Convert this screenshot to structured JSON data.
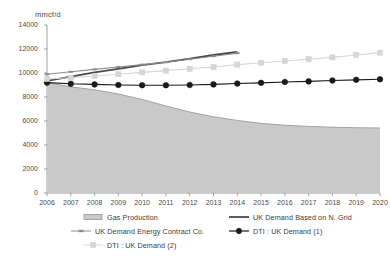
{
  "chart_data": {
    "type": "line",
    "title": "",
    "subtitle": "",
    "xlabel": "",
    "ylabel": "mmcf/d",
    "ylim": [
      0,
      14000
    ],
    "xlim": [
      2006,
      2020
    ],
    "grid": false,
    "legend_position": "bottom",
    "y_ticks": [
      "0",
      "2000",
      "4000",
      "6000",
      "8000",
      "10000",
      "12000",
      "14000"
    ],
    "y_tick_values": [
      0,
      2000,
      4000,
      6000,
      8000,
      10000,
      12000,
      14000
    ],
    "categories": [
      "2006",
      "2007",
      "2008",
      "2009",
      "2010",
      "2011",
      "2012",
      "2013",
      "2014",
      "2015",
      "2016",
      "2017",
      "2018",
      "2019",
      "2020"
    ],
    "x": [
      2006,
      2007,
      2008,
      2009,
      2010,
      2011,
      2012,
      2013,
      2014,
      2015,
      2016,
      2017,
      2018,
      2019,
      2020
    ],
    "series": [
      {
        "name": "Gas Production",
        "type": "area",
        "color": "#c9c9c9",
        "edge_color": "#9a9a9a",
        "values": [
          9200,
          8850,
          8600,
          8250,
          7800,
          7250,
          6750,
          6350,
          6050,
          5800,
          5650,
          5550,
          5480,
          5440,
          5420
        ]
      },
      {
        "name": "UK Demand Based on N. Grid",
        "type": "line",
        "color": "#4a4a4a",
        "marker": "none",
        "values": [
          9350,
          9700,
          10050,
          10350,
          10650,
          10900,
          11200,
          11500,
          11750,
          null,
          null,
          null,
          null,
          null,
          null
        ]
      },
      {
        "name": "UK Demand Energy Contract Co.",
        "type": "line",
        "color": "#8c8c8c",
        "marker": "dash",
        "values": [
          9900,
          10100,
          10300,
          10500,
          10700,
          10900,
          11150,
          11400,
          11650,
          null,
          null,
          null,
          null,
          null,
          null
        ]
      },
      {
        "name": "DTI : UK Demand (1)",
        "type": "line",
        "color": "#1a1a1a",
        "marker": "circle",
        "values": [
          9200,
          9100,
          9050,
          9000,
          8980,
          8980,
          9000,
          9050,
          9120,
          9180,
          9250,
          9300,
          9380,
          9430,
          9480
        ]
      },
      {
        "name": "DTI : UK Demand (2)",
        "type": "line",
        "color": "#d6d6d6",
        "marker": "square",
        "values": [
          9500,
          9600,
          9750,
          9900,
          10050,
          10200,
          10350,
          10500,
          10700,
          10850,
          11000,
          11150,
          11300,
          11500,
          11700
        ]
      }
    ],
    "legend": [
      {
        "label": "Gas Production",
        "marker": "area-swatch",
        "color": "#c9c9c9"
      },
      {
        "label": "UK Demand Based on N. Grid",
        "marker": "line",
        "color": "#4a4a4a"
      },
      {
        "label": "UK Demand Energy Contract Co.",
        "marker": "line-dash",
        "color": "#8c8c8c"
      },
      {
        "label": "DTI : UK Demand (1)",
        "marker": "line-circle",
        "color": "#1a1a1a"
      },
      {
        "label": "DTI : UK Demand (2)",
        "marker": "line-square",
        "color": "#d6d6d6"
      }
    ]
  }
}
